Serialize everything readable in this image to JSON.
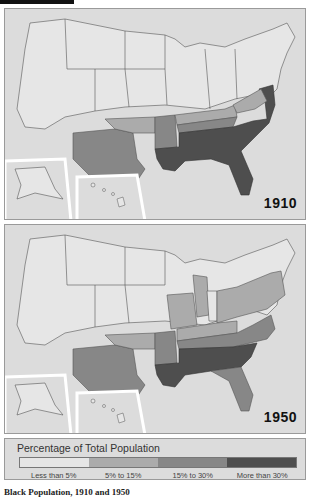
{
  "maps": [
    {
      "year_label": "1910",
      "regions": {
        "less_than_5": [
          "West",
          "Midwest",
          "Northeast",
          "Alaska",
          "Hawaii"
        ],
        "5_to_15": [
          "Oklahoma",
          "Kentucky",
          "West Virginia"
        ],
        "15_to_30": [
          "Texas",
          "Arkansas",
          "Tennessee",
          "Maryland",
          "Delaware"
        ],
        "more_than_30": [
          "Louisiana",
          "Mississippi",
          "Alabama",
          "Georgia",
          "Florida",
          "South Carolina",
          "North Carolina",
          "Virginia"
        ]
      }
    },
    {
      "year_label": "1950",
      "regions": {
        "less_than_5": [
          "West",
          "Upper Midwest",
          "Northern New England",
          "Indiana",
          "Alaska",
          "Hawaii"
        ],
        "5_to_15": [
          "Oklahoma",
          "Missouri",
          "Illinois",
          "Michigan",
          "Ohio",
          "Kentucky",
          "West Virginia",
          "Pennsylvania",
          "New York",
          "New Jersey"
        ],
        "15_to_30": [
          "Texas",
          "Arkansas",
          "Tennessee",
          "Florida",
          "North Carolina",
          "Virginia",
          "Maryland",
          "Delaware"
        ],
        "more_than_30": [
          "Louisiana",
          "Mississippi",
          "Alabama",
          "Georgia",
          "South Carolina"
        ]
      }
    }
  ],
  "legend": {
    "title": "Percentage of Total Population",
    "categories": [
      {
        "label": "Less than 5%",
        "color": "#e6e6e6"
      },
      {
        "label": "5% to 15%",
        "color": "#ababab"
      },
      {
        "label": "15% to 30%",
        "color": "#878787"
      },
      {
        "label": "More than 30%",
        "color": "#4e4e4e"
      }
    ]
  },
  "caption": "Black Population, 1910 and 1950"
}
